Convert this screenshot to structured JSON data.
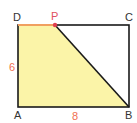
{
  "figure": {
    "colors": {
      "fill": "#fbf4a8",
      "outline": "#1a1a1a",
      "highlight_segment": "#f0a060",
      "point_p": "#e04050",
      "vertex_label": "#333333",
      "point_p_label": "#e05060",
      "dimension_label": "#f07050"
    },
    "vertices": {
      "A": {
        "label": "A",
        "x": 18,
        "y": 107
      },
      "B": {
        "label": "B",
        "x": 129,
        "y": 107
      },
      "C": {
        "label": "C",
        "x": 129,
        "y": 25
      },
      "D": {
        "label": "D",
        "x": 18,
        "y": 25
      },
      "P": {
        "label": "P",
        "x": 55,
        "y": 25
      }
    },
    "dimensions": {
      "AD": "6",
      "AB": "8"
    }
  }
}
